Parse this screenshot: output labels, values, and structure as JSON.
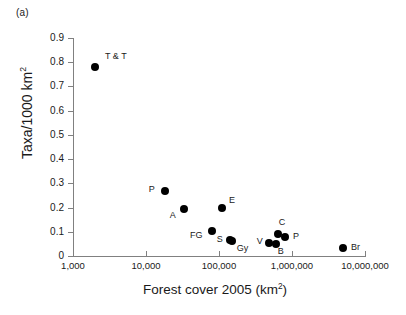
{
  "panel": {
    "label": "(a)"
  },
  "chart_data": {
    "type": "scatter",
    "title": "",
    "xlabel": "Forest cover 2005 (km2)",
    "ylabel": "Taxa/1000 km2",
    "xscale": "log",
    "yscale": "linear",
    "xlim": [
      1000,
      10000000
    ],
    "ylim": [
      0,
      0.9
    ],
    "grid": false,
    "legend": "none",
    "xticks": [
      {
        "value": 1000,
        "label": "1,000"
      },
      {
        "value": 10000,
        "label": "10,000"
      },
      {
        "value": 100000,
        "label": "100,000"
      },
      {
        "value": 1000000,
        "label": "1,000,000"
      },
      {
        "value": 10000000,
        "label": "10,000,000"
      }
    ],
    "yticks": [
      {
        "value": 0.9,
        "label": "0.9"
      },
      {
        "value": 0.8,
        "label": "0.8"
      },
      {
        "value": 0.7,
        "label": "0.7"
      },
      {
        "value": 0.6,
        "label": "0.6"
      },
      {
        "value": 0.5,
        "label": "0.5"
      },
      {
        "value": 0.4,
        "label": "0.4"
      },
      {
        "value": 0.3,
        "label": "0.3"
      },
      {
        "value": 0.2,
        "label": "0.2"
      },
      {
        "value": 0.1,
        "label": "0.1"
      },
      {
        "value": 0,
        "label": "0"
      }
    ],
    "marker": {
      "shape": "circle",
      "color": "#000000",
      "size": 8
    },
    "points": [
      {
        "label": "T & T",
        "x": 2000,
        "y": 0.78,
        "lx": 10,
        "ly": -11
      },
      {
        "label": "P",
        "x": 18000,
        "y": 0.27,
        "lx": -16,
        "ly": -2
      },
      {
        "label": "A",
        "x": 33000,
        "y": 0.195,
        "lx": -14,
        "ly": 6
      },
      {
        "label": "E",
        "x": 110000,
        "y": 0.2,
        "lx": 7,
        "ly": -8
      },
      {
        "label": "FG",
        "x": 80000,
        "y": 0.105,
        "lx": -22,
        "ly": 4
      },
      {
        "label": "S",
        "x": 140000,
        "y": 0.065,
        "lx": -13,
        "ly": -1
      },
      {
        "label": "Gy",
        "x": 150000,
        "y": 0.06,
        "lx": 5,
        "ly": 7
      },
      {
        "label": "V",
        "x": 480000,
        "y": 0.055,
        "lx": -12,
        "ly": -2
      },
      {
        "label": "B",
        "x": 600000,
        "y": 0.05,
        "lx": 2,
        "ly": 7
      },
      {
        "label": "C",
        "x": 640000,
        "y": 0.09,
        "lx": 1,
        "ly": -12
      },
      {
        "label": "P",
        "x": 800000,
        "y": 0.08,
        "lx": 8,
        "ly": -1
      },
      {
        "label": "Br",
        "x": 5000000,
        "y": 0.035,
        "lx": 8,
        "ly": -1
      }
    ]
  }
}
